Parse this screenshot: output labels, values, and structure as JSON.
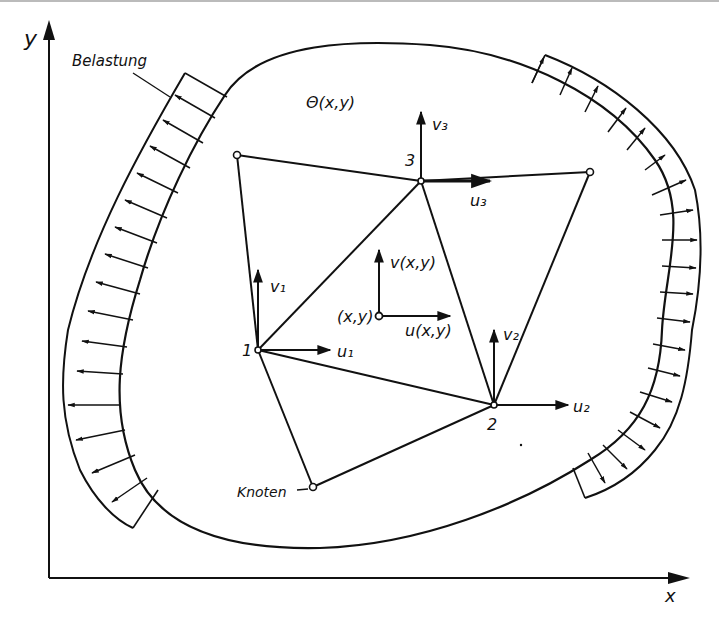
{
  "figure": {
    "axes": {
      "x_label": "x",
      "y_label": "y"
    },
    "domain_label": "Θ(x,y)",
    "load_label": "Belastung",
    "node_label": "Knoten",
    "nodes": [
      {
        "id": "1",
        "label": "1",
        "u": "u1",
        "v": "v1"
      },
      {
        "id": "2",
        "label": "2",
        "u": "u2",
        "v": "v2"
      },
      {
        "id": "3",
        "label": "3",
        "u": "u3",
        "v": "v3"
      }
    ],
    "field_point": {
      "label": "(x,y)",
      "u": "u(x,y)",
      "v": "v(x,y)"
    },
    "colors": {
      "ink": "#111111",
      "background": "#ffffff"
    }
  }
}
